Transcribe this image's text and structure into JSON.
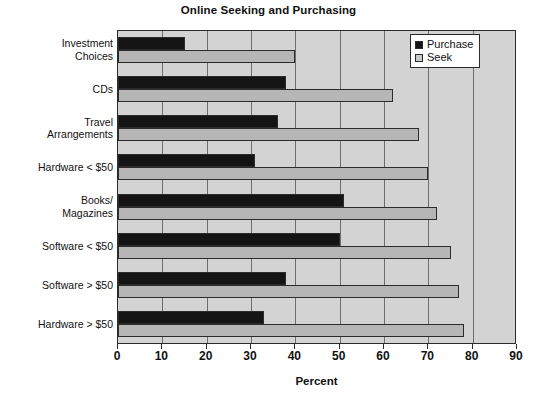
{
  "chart_data": {
    "type": "bar",
    "orientation": "horizontal",
    "title": "Online Seeking and Purchasing",
    "xlabel": "Percent",
    "ylabel": "",
    "xlim": [
      0,
      90
    ],
    "xticks": [
      0,
      10,
      20,
      30,
      40,
      50,
      60,
      70,
      80,
      90
    ],
    "grid": true,
    "legend_position": "top-right",
    "categories": [
      "Investment\nChoices",
      "CDs",
      "Travel\nArrangements",
      "Hardware < $50",
      "Books/\nMagazines",
      "Software < $50",
      "Software > $50",
      "Hardware > $50"
    ],
    "series": [
      {
        "name": "Purchase",
        "color": "#141414",
        "values": [
          15,
          38,
          36,
          31,
          51,
          50,
          38,
          33
        ]
      },
      {
        "name": "Seek",
        "color": "#b6b6b6",
        "values": [
          40,
          62,
          68,
          70,
          72,
          75,
          77,
          78
        ]
      }
    ]
  },
  "legend": {
    "entries": [
      {
        "label": "Purchase",
        "icon": "filled-square-black"
      },
      {
        "label": "Seek",
        "icon": "filled-square-gray"
      }
    ]
  },
  "colors": {
    "plot_background": "#d3d3d3",
    "axis": "#2b2b2b",
    "gridline": "#6d6d6d",
    "purchase": "#141414",
    "seek": "#b6b6b6",
    "page_background": "#ffffff"
  }
}
